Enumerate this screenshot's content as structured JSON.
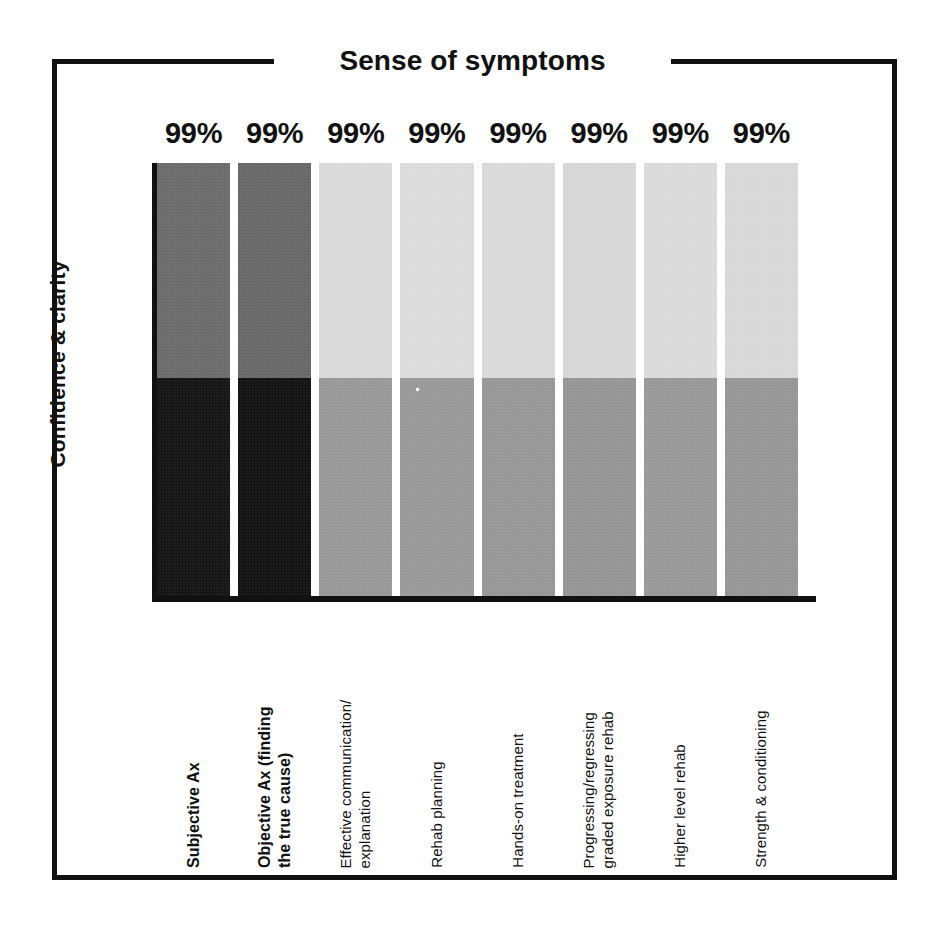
{
  "chart_data": {
    "type": "bar",
    "title": "Sense of symptoms",
    "xlabel": "",
    "ylabel": "Confidence & clarity",
    "grid": false,
    "legend": "none",
    "stacked": true,
    "ylim": [
      0,
      100
    ],
    "categories": [
      "Subjective Ax",
      "Objective Ax (finding the true cause)",
      "Effective communication/ explanation",
      "Rehab planning",
      "Hands-on treatment",
      "Progressing/regressing graded exposure rehab",
      "Higher level rehab",
      "Strength & conditioning"
    ],
    "data_labels": [
      "99%",
      "99%",
      "99%",
      "99%",
      "99%",
      "99%",
      "99%",
      "99%"
    ],
    "values": [
      99,
      99,
      99,
      99,
      99,
      99,
      99,
      99
    ],
    "series": [
      {
        "name": "Confidence & clarity (upper segment)",
        "values": [
          49.5,
          49.5,
          49.5,
          49.5,
          49.5,
          49.5,
          49.5,
          49.5
        ]
      },
      {
        "name": "Sense of symptoms (lower segment)",
        "values": [
          50.5,
          50.5,
          50.5,
          50.5,
          50.5,
          50.5,
          50.5,
          50.5
        ]
      }
    ],
    "split_fraction": 0.496,
    "bars": [
      {
        "label": "Subjective Ax",
        "emphasis": true,
        "value_label": "99%",
        "top_color": "#6d6d6d",
        "bottom_color": "#151515"
      },
      {
        "label": "Objective Ax (finding the true cause)",
        "emphasis": true,
        "value_label": "99%",
        "top_color": "#6a6a6a",
        "bottom_color": "#121212"
      },
      {
        "label": "Effective communication/ explanation",
        "emphasis": false,
        "value_label": "99%",
        "top_color": "#dcdcdc",
        "bottom_color": "#9a9a9a"
      },
      {
        "label": "Rehab planning",
        "emphasis": false,
        "value_label": "99%",
        "top_color": "#dedede",
        "bottom_color": "#9b9b9b"
      },
      {
        "label": "Hands-on treatment",
        "emphasis": false,
        "value_label": "99%",
        "top_color": "#dcdcdc",
        "bottom_color": "#999999"
      },
      {
        "label": "Progressing/regressing graded exposure rehab",
        "emphasis": false,
        "value_label": "99%",
        "top_color": "#dadada",
        "bottom_color": "#979797"
      },
      {
        "label": "Higher level rehab",
        "emphasis": false,
        "value_label": "99%",
        "top_color": "#dddddd",
        "bottom_color": "#9a9a9a"
      },
      {
        "label": "Strength & conditioning",
        "emphasis": false,
        "value_label": "99%",
        "top_color": "#dbdbdb",
        "bottom_color": "#989898"
      }
    ],
    "category_lines": [
      [
        "Subjective Ax"
      ],
      [
        "Objective Ax (finding",
        "the true cause)"
      ],
      [
        "Effective communication/",
        "explanation"
      ],
      [
        "Rehab planning"
      ],
      [
        "Hands-on treatment"
      ],
      [
        "Progressing/regressing",
        "graded exposure rehab"
      ],
      [
        "Higher level rehab"
      ],
      [
        "Strength & conditioning"
      ]
    ]
  },
  "colors": {
    "ink": "#111111",
    "background": "#ffffff",
    "dark_bar_top": "#6d6d6d",
    "dark_bar_bottom": "#151515",
    "light_bar_top": "#dcdcdc",
    "light_bar_bottom": "#999999"
  }
}
